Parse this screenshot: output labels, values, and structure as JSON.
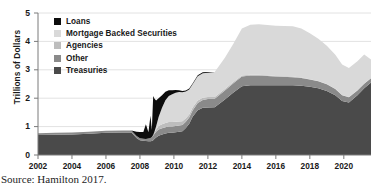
{
  "chart_data": {
    "type": "area",
    "stacked": true,
    "title": "",
    "subtitle": "",
    "xlabel": "",
    "ylabel": "Trillions of Dollars",
    "xlim": [
      2002,
      2021.6
    ],
    "ylim": [
      0,
      5
    ],
    "yticks": [
      0,
      1,
      2,
      3,
      4,
      5
    ],
    "ytick_labels": [
      "0",
      "1",
      "2",
      "3",
      "4",
      "5"
    ],
    "xticks": [
      2002,
      2004,
      2006,
      2008,
      2010,
      2012,
      2014,
      2016,
      2018,
      2020
    ],
    "xtick_labels": [
      "2002",
      "2004",
      "2006",
      "2008",
      "2010",
      "2012",
      "2014",
      "2016",
      "2018",
      "2020"
    ],
    "grid": true,
    "grid_axis": "y",
    "legend_position": "upper-left",
    "legend_order": [
      "Loans",
      "Mortgage Backed Securities",
      "Agencies",
      "Other",
      "Treasuries"
    ],
    "stack_order_bottom_to_top": [
      "Treasuries",
      "Other",
      "Agencies",
      "Mortgage Backed Securities",
      "Loans"
    ],
    "colors": {
      "Loans": "#0d0d0d",
      "Mortgage Backed Securities": "#d9d9d9",
      "Agencies": "#bdbdbd",
      "Other": "#8a8a8a",
      "Treasuries": "#4a4a4a",
      "grid": "#e2e2e2",
      "axis": "#7a7a7a",
      "text": "#1a1a1a",
      "background": "#ffffff"
    },
    "x": [
      2002.0,
      2003.0,
      2004.0,
      2005.0,
      2006.0,
      2007.0,
      2007.5,
      2007.8,
      2008.0,
      2008.2,
      2008.35,
      2008.5,
      2008.62,
      2008.7,
      2008.78,
      2008.85,
      2008.95,
      2009.1,
      2009.3,
      2009.5,
      2009.7,
      2009.9,
      2010.1,
      2010.3,
      2010.5,
      2010.7,
      2010.9,
      2011.1,
      2011.4,
      2011.7,
      2012.0,
      2012.4,
      2013.0,
      2013.5,
      2014.0,
      2014.5,
      2015.0,
      2016.0,
      2017.0,
      2017.5,
      2018.0,
      2018.5,
      2019.0,
      2019.5,
      2019.9,
      2020.3,
      2020.8,
      2021.2,
      2021.6
    ],
    "series": [
      {
        "name": "Treasuries",
        "values": [
          0.7,
          0.71,
          0.72,
          0.75,
          0.78,
          0.79,
          0.79,
          0.6,
          0.52,
          0.5,
          0.49,
          0.48,
          0.48,
          0.49,
          0.52,
          0.56,
          0.62,
          0.68,
          0.72,
          0.76,
          0.78,
          0.78,
          0.8,
          0.82,
          0.84,
          0.95,
          1.1,
          1.35,
          1.58,
          1.66,
          1.67,
          1.68,
          1.95,
          2.2,
          2.42,
          2.46,
          2.46,
          2.46,
          2.46,
          2.44,
          2.4,
          2.35,
          2.25,
          2.1,
          1.9,
          1.85,
          2.1,
          2.35,
          2.55
        ]
      },
      {
        "name": "Other",
        "values": [
          0.07,
          0.07,
          0.07,
          0.07,
          0.07,
          0.07,
          0.07,
          0.07,
          0.07,
          0.07,
          0.07,
          0.1,
          0.12,
          0.14,
          0.16,
          0.18,
          0.2,
          0.22,
          0.22,
          0.22,
          0.22,
          0.22,
          0.22,
          0.22,
          0.22,
          0.22,
          0.22,
          0.22,
          0.25,
          0.28,
          0.3,
          0.3,
          0.32,
          0.33,
          0.34,
          0.34,
          0.34,
          0.3,
          0.28,
          0.27,
          0.26,
          0.25,
          0.24,
          0.22,
          0.2,
          0.18,
          0.17,
          0.16,
          0.15
        ]
      },
      {
        "name": "Agencies",
        "values": [
          0.0,
          0.0,
          0.0,
          0.0,
          0.0,
          0.0,
          0.0,
          0.0,
          0.0,
          0.0,
          0.0,
          0.0,
          0.0,
          0.0,
          0.02,
          0.05,
          0.08,
          0.12,
          0.14,
          0.15,
          0.16,
          0.16,
          0.15,
          0.14,
          0.13,
          0.12,
          0.11,
          0.1,
          0.09,
          0.08,
          0.07,
          0.06,
          0.05,
          0.04,
          0.04,
          0.03,
          0.03,
          0.02,
          0.02,
          0.02,
          0.01,
          0.01,
          0.01,
          0.01,
          0.01,
          0.01,
          0.01,
          0.01,
          0.01
        ]
      },
      {
        "name": "Mortgage Backed Securities",
        "values": [
          0.0,
          0.0,
          0.0,
          0.0,
          0.0,
          0.0,
          0.0,
          0.0,
          0.0,
          0.0,
          0.0,
          0.0,
          0.0,
          0.0,
          0.0,
          0.02,
          0.1,
          0.32,
          0.58,
          0.8,
          0.92,
          0.98,
          1.02,
          1.04,
          1.02,
          0.95,
          0.88,
          0.82,
          0.85,
          0.86,
          0.86,
          0.88,
          1.1,
          1.35,
          1.65,
          1.76,
          1.77,
          1.77,
          1.77,
          1.72,
          1.62,
          1.48,
          1.35,
          1.2,
          1.08,
          1.02,
          1.02,
          1.02,
          0.65
        ]
      },
      {
        "name": "Loans",
        "values": [
          0.0,
          0.0,
          0.0,
          0.0,
          0.0,
          0.0,
          0.0,
          0.15,
          0.22,
          0.24,
          0.52,
          0.22,
          0.78,
          0.25,
          1.38,
          1.18,
          0.92,
          0.66,
          0.44,
          0.3,
          0.2,
          0.14,
          0.1,
          0.06,
          0.04,
          0.03,
          0.03,
          0.03,
          0.04,
          0.03,
          0.02,
          0.0,
          0.0,
          0.0,
          0.0,
          0.0,
          0.0,
          0.0,
          0.0,
          0.0,
          0.0,
          0.0,
          0.0,
          0.0,
          0.0,
          0.0,
          0.0,
          0.0,
          0.0
        ]
      }
    ]
  },
  "legend": {
    "items": [
      {
        "label": "Loans",
        "color": "#0d0d0d"
      },
      {
        "label": "Mortgage Backed Securities",
        "color": "#d9d9d9"
      },
      {
        "label": "Agencies",
        "color": "#bdbdbd"
      },
      {
        "label": "Other",
        "color": "#8a8a8a"
      },
      {
        "label": "Treasuries",
        "color": "#4a4a4a"
      }
    ]
  },
  "axis": {
    "ylabel": "Trillions of Dollars"
  },
  "caption": {
    "source": "Source: Hamilton 2017."
  }
}
